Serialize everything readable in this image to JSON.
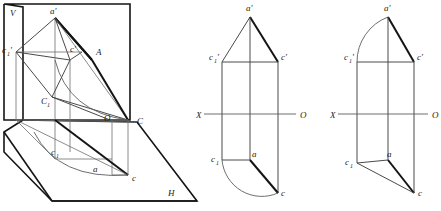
{
  "figure": {
    "background_color": "#ffffff",
    "line_color_thin": "#6e6e6e",
    "line_color_thick": "#141414",
    "label_color": "#1b1b1b"
  },
  "pictorial_view": {
    "name": "pictorial-projection",
    "plane_labels": {
      "vertical_plane": "V",
      "horizontal_plane": "H"
    },
    "points": [
      {
        "id": "a-prime",
        "label": "a'",
        "x": 50,
        "y": 12
      },
      {
        "id": "c1-prime",
        "label": "c",
        "sub": "1",
        "prime": "'",
        "x": 8,
        "y": 51
      },
      {
        "id": "c-prime",
        "label": "c'",
        "x": 72,
        "y": 52
      },
      {
        "id": "A",
        "label": "A",
        "x": 96,
        "y": 53
      },
      {
        "id": "C1-upper",
        "label": "C",
        "sub": "1",
        "x": 45,
        "y": 104
      },
      {
        "id": "O-point",
        "label": "O",
        "x": 106,
        "y": 118
      },
      {
        "id": "C",
        "label": "C",
        "x": 137,
        "y": 122
      },
      {
        "id": "c1-lower",
        "label": "c",
        "sub": "1",
        "x": 54,
        "y": 152
      },
      {
        "id": "a-lower",
        "label": "a",
        "x": 95,
        "y": 169
      },
      {
        "id": "c-lower",
        "label": "c",
        "x": 133,
        "y": 178
      },
      {
        "id": "H-label",
        "label": "H",
        "x": 168,
        "y": 193
      },
      {
        "id": "V-label",
        "label": "V",
        "x": 10,
        "y": 14
      }
    ]
  },
  "middle_view": {
    "name": "front-and-top-projection",
    "axis": {
      "left_label": "X",
      "right_label": "O",
      "y": 114
    },
    "points": [
      {
        "id": "a-prime",
        "label": "a'",
        "x": 250,
        "y": 8
      },
      {
        "id": "c1-prime",
        "label": "c",
        "sub": "1",
        "prime": "'",
        "x": 213,
        "y": 57
      },
      {
        "id": "c-prime",
        "label": "c'",
        "x": 282,
        "y": 57
      },
      {
        "id": "c1",
        "label": "c",
        "sub": "1",
        "x": 213,
        "y": 158
      },
      {
        "id": "a",
        "label": "a",
        "x": 252,
        "y": 152
      },
      {
        "id": "c",
        "label": "c",
        "x": 282,
        "y": 192
      }
    ]
  },
  "right_view": {
    "name": "rotated-projection",
    "axis": {
      "left_label": "X",
      "right_label": "O",
      "y": 114
    },
    "points": [
      {
        "id": "a-prime",
        "label": "a'",
        "x": 386,
        "y": 8
      },
      {
        "id": "c1-prime",
        "label": "c",
        "sub": "1",
        "prime": "'",
        "x": 347,
        "y": 57
      },
      {
        "id": "c-prime",
        "label": "c'",
        "x": 417,
        "y": 57
      },
      {
        "id": "c1",
        "label": "c",
        "sub": "1",
        "x": 347,
        "y": 161
      },
      {
        "id": "a",
        "label": "a",
        "x": 387,
        "y": 152
      },
      {
        "id": "c",
        "label": "c",
        "x": 419,
        "y": 192
      }
    ]
  }
}
